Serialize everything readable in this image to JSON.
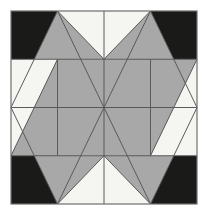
{
  "figure": {
    "name": "quilt-block-pattern",
    "width": 208,
    "height": 215,
    "background_color": "#ffffff"
  },
  "palette": {
    "background": "#ffffff",
    "off_white": "#f5f5f2",
    "gray": "#a8a8a8",
    "black": "#1a1a18",
    "line": "#5a5a5a",
    "border": "#6e6e6e"
  },
  "block": {
    "x0": 11,
    "y0": 11,
    "x1": 197,
    "y1": 204,
    "grid_columns": 4,
    "grid_rows": 4,
    "cell_width": 46.5,
    "cell_height": 48.25
  },
  "grid_lines": {
    "vertical_x": [
      57.5,
      104,
      150.5
    ],
    "horizontal_y": [
      59.25,
      107.5,
      155.75
    ],
    "stroke": "#5a5a5a",
    "stroke_width": 1
  },
  "corner_squares": {
    "fill": "#1a1a18",
    "size": 37,
    "items": [
      {
        "name": "corner-square-top-left",
        "x": 11,
        "y": 11
      },
      {
        "name": "corner-square-top-right",
        "x": 160,
        "y": 11
      },
      {
        "name": "corner-square-bottom-left",
        "x": 11,
        "y": 167
      },
      {
        "name": "corner-square-bottom-right",
        "x": 160,
        "y": 167
      }
    ]
  },
  "shapes": {
    "gray_fill": "#a8a8a8",
    "offwhite_fill": "#f5f5f2",
    "triangles": [
      {
        "name": "triangle-top-left-large",
        "points": "11,107.5 104,11 104,107.5",
        "fill": "#a8a8a8"
      },
      {
        "name": "triangle-top-right-large",
        "points": "104,11 197,107.5 104,107.5",
        "fill": "#a8a8a8"
      },
      {
        "name": "triangle-bottom-right-large",
        "points": "197,107.5 104,204 104,107.5",
        "fill": "#a8a8a8"
      },
      {
        "name": "triangle-bottom-left-large",
        "points": "104,204 11,107.5 104,107.5",
        "fill": "#a8a8a8"
      },
      {
        "name": "notch-top-center-left",
        "points": "104,11 104,107.5 57.5,11",
        "fill": "#f5f5f2"
      },
      {
        "name": "notch-top-center-right",
        "points": "104,11 150.5,11 104,107.5",
        "fill": "#f5f5f2"
      },
      {
        "name": "notch-left-upper",
        "points": "11,107.5 11,59.25 57.5,107.5",
        "fill": "#f5f5f2"
      },
      {
        "name": "notch-left-lower",
        "points": "11,107.5 57.5,107.5 11,155.75",
        "fill": "#f5f5f2"
      },
      {
        "name": "notch-right-upper",
        "points": "197,107.5 150.5,107.5 197,59.25",
        "fill": "#f5f5f2"
      },
      {
        "name": "notch-right-lower",
        "points": "197,107.5 197,155.75 150.5,107.5",
        "fill": "#f5f5f2"
      },
      {
        "name": "notch-bottom-center-right",
        "points": "104,204 104,107.5 150.5,204",
        "fill": "#f5f5f2"
      },
      {
        "name": "notch-bottom-center-left",
        "points": "104,204 57.5,204 104,107.5",
        "fill": "#f5f5f2"
      }
    ],
    "pinwheel_arms": [
      {
        "name": "arm-upper-left",
        "points": "11,155.75 104,107.5 57.5,107.5 11,107.5",
        "fill": "#a8a8a8"
      },
      {
        "name": "arm-upper-right",
        "points": "197,59.25 104,107.5 150.5,107.5 197,107.5",
        "fill": "#a8a8a8"
      }
    ]
  },
  "labels": {
    "alt_text": "Symmetric four-fold quilt block with gray triangles, black corner squares and off-white ground"
  }
}
